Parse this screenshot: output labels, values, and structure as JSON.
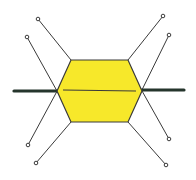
{
  "diagram": {
    "type": "molecular-structure-sketch",
    "colors": {
      "hexagon_fill": "#f7e82a",
      "stroke": "#3a3a3a",
      "thick_bond": "#25352c",
      "background": "#ffffff"
    },
    "hexagon": {
      "points": [
        [
          71,
          60
        ],
        [
          128,
          60
        ],
        [
          142,
          91
        ],
        [
          128,
          122
        ],
        [
          71,
          122
        ],
        [
          57,
          91
        ]
      ],
      "midline": [
        [
          63,
          90
        ],
        [
          136,
          91
        ]
      ]
    },
    "thick_bonds": [
      {
        "name": "left",
        "from": [
          14,
          91
        ],
        "to": [
          57,
          91
        ]
      },
      {
        "name": "right",
        "from": [
          142,
          90
        ],
        "to": [
          184,
          90
        ]
      }
    ],
    "thin_lines": [
      {
        "name": "top-left-outer",
        "from": [
          38,
          19
        ],
        "to": [
          71,
          60
        ]
      },
      {
        "name": "top-left-inner",
        "from": [
          27,
          37
        ],
        "to": [
          62,
          100
        ]
      },
      {
        "name": "bottom-left-inner",
        "from": [
          28,
          145
        ],
        "to": [
          62,
          82
        ]
      },
      {
        "name": "bottom-left-outer",
        "from": [
          36,
          163
        ],
        "to": [
          71,
          122
        ]
      },
      {
        "name": "top-right-outer",
        "from": [
          163,
          16
        ],
        "to": [
          128,
          60
        ]
      },
      {
        "name": "top-right-inner",
        "from": [
          169,
          35
        ],
        "to": [
          137,
          100
        ]
      },
      {
        "name": "bottom-right-inner",
        "from": [
          169,
          139
        ],
        "to": [
          137,
          82
        ]
      },
      {
        "name": "bottom-right-outer",
        "from": [
          166,
          165
        ],
        "to": [
          128,
          122
        ]
      }
    ]
  }
}
